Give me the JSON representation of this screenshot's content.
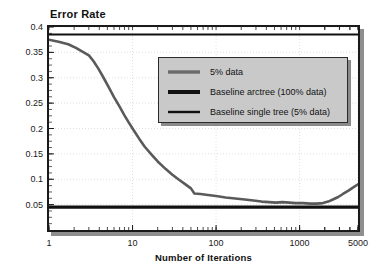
{
  "chart_data": {
    "type": "line",
    "title": "Error Rate",
    "xlabel": "Number of Iterations",
    "ylabel": "Error Rate",
    "xscale": "log",
    "xlim": [
      1,
      5000
    ],
    "ylim": [
      0,
      0.4
    ],
    "grid": true,
    "legend_position": "upper-center-right",
    "xticks": [
      {
        "value": 1,
        "label": "1"
      },
      {
        "value": 10,
        "label": "10"
      },
      {
        "value": 100,
        "label": "100"
      },
      {
        "value": 1000,
        "label": "1000"
      },
      {
        "value": 5000,
        "label": "5000"
      }
    ],
    "yticks": [
      {
        "value": 0.05,
        "label": "0.05"
      },
      {
        "value": 0.1,
        "label": "0.1"
      },
      {
        "value": 0.15,
        "label": "0.15"
      },
      {
        "value": 0.2,
        "label": "0.2"
      },
      {
        "value": 0.25,
        "label": "0.25"
      },
      {
        "value": 0.3,
        "label": "0.3"
      },
      {
        "value": 0.35,
        "label": "0.35"
      },
      {
        "value": 0.4,
        "label": "0.4"
      }
    ],
    "series": [
      {
        "name": "5% data",
        "style": "line",
        "color": "#5a5a5a",
        "width": 2.6,
        "points": [
          [
            1,
            0.375
          ],
          [
            1.3,
            0.371
          ],
          [
            1.7,
            0.366
          ],
          [
            2.1,
            0.359
          ],
          [
            2.6,
            0.35
          ],
          [
            3.0,
            0.344
          ],
          [
            3.4,
            0.333
          ],
          [
            3.9,
            0.318
          ],
          [
            4.5,
            0.3
          ],
          [
            5.2,
            0.281
          ],
          [
            6.0,
            0.262
          ],
          [
            7.0,
            0.243
          ],
          [
            8.0,
            0.226
          ],
          [
            9.0,
            0.212
          ],
          [
            10,
            0.2
          ],
          [
            12,
            0.18
          ],
          [
            14,
            0.164
          ],
          [
            17,
            0.148
          ],
          [
            20,
            0.135
          ],
          [
            25,
            0.12
          ],
          [
            30,
            0.109
          ],
          [
            36,
            0.099
          ],
          [
            43,
            0.09
          ],
          [
            50,
            0.082
          ],
          [
            55,
            0.072
          ],
          [
            65,
            0.071
          ],
          [
            80,
            0.069
          ],
          [
            100,
            0.067
          ],
          [
            130,
            0.064
          ],
          [
            170,
            0.062
          ],
          [
            220,
            0.06
          ],
          [
            280,
            0.058
          ],
          [
            350,
            0.056
          ],
          [
            430,
            0.055
          ],
          [
            520,
            0.054
          ],
          [
            620,
            0.055
          ],
          [
            750,
            0.054
          ],
          [
            900,
            0.053
          ],
          [
            1100,
            0.053
          ],
          [
            1350,
            0.052
          ],
          [
            1600,
            0.052
          ],
          [
            1900,
            0.053
          ],
          [
            2200,
            0.056
          ],
          [
            2500,
            0.06
          ],
          [
            2900,
            0.065
          ],
          [
            3300,
            0.071
          ],
          [
            3800,
            0.077
          ],
          [
            4300,
            0.083
          ],
          [
            5000,
            0.09
          ]
        ]
      },
      {
        "name": "Baseline arctree (100% data)",
        "style": "hline",
        "color": "#111111",
        "width": 3.2,
        "value": 0.045
      },
      {
        "name": "Baseline single tree (5% data)",
        "style": "hline",
        "color": "#111111",
        "width": 2.0,
        "value": 0.385
      }
    ]
  },
  "legend": {
    "items": [
      {
        "label": "5% data"
      },
      {
        "label": "Baseline arctree (100% data)"
      },
      {
        "label": "Baseline single tree (5% data)"
      }
    ]
  }
}
